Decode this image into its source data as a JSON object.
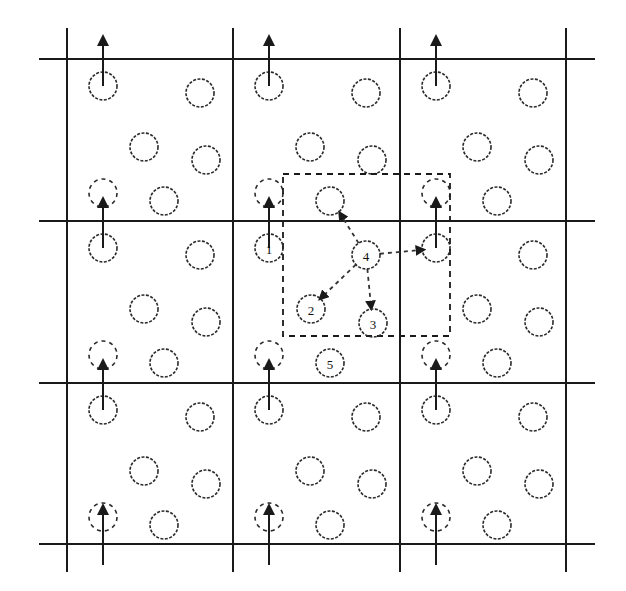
{
  "diagram": {
    "title": "",
    "type": "periodic-cell-neighbor-list",
    "colors": {
      "line": "#1a1a1a",
      "background": "#ffffff"
    },
    "grid": {
      "columns_x": [
        67,
        233,
        400,
        566
      ],
      "rows_y": [
        59,
        221,
        383,
        544
      ],
      "h_extent": [
        39,
        595
      ],
      "v_extent": [
        28,
        572
      ]
    },
    "cell_template": {
      "radius": 14,
      "particles": [
        {
          "dx": 36,
          "dy": 27,
          "role": "boundary-top"
        },
        {
          "dx": 133,
          "dy": 34
        },
        {
          "dx": 77,
          "dy": 88
        },
        {
          "dx": 139,
          "dy": 101
        },
        {
          "dx": 97,
          "dy": 142
        }
      ],
      "ghost": {
        "dx": 36,
        "dy": 134
      }
    },
    "cutoff_box": {
      "x": 283,
      "y": 174,
      "width": 167,
      "height": 162
    },
    "labeled_particles": [
      {
        "label": "1",
        "x": 269,
        "y": 248
      },
      {
        "label": "2",
        "x": 311,
        "y": 309
      },
      {
        "label": "3",
        "x": 373,
        "y": 323
      },
      {
        "label": "4",
        "x": 366,
        "y": 255
      },
      {
        "label": "5",
        "x": 330,
        "y": 363
      }
    ],
    "pair_arrows": [
      {
        "from": "4",
        "to_x": 332,
        "to_y": 200,
        "head_x": 341,
        "head_y": 215
      },
      {
        "from": "4",
        "to": "2",
        "head_x": 322,
        "head_y": 297
      },
      {
        "from": "4",
        "to": "3",
        "head_x": 371,
        "head_y": 306
      },
      {
        "from": "4",
        "to_x": 436,
        "to_y": 247,
        "head_x": 421,
        "head_y": 250
      }
    ]
  }
}
